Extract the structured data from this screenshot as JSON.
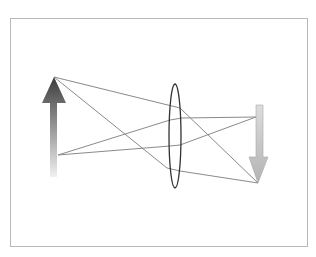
{
  "diagram": {
    "frame": {
      "x": 10,
      "y": 18,
      "width": 297,
      "height": 228,
      "stroke": "#b8b8b8"
    },
    "colors": {
      "ray": "#8a8a8a",
      "lens": "#333333",
      "object_dark": "#3c3c3c",
      "object_light": "#f0f0f0",
      "image_dark": "#b4b4b4",
      "image_light": "#dcdcdc"
    },
    "object_arrow": {
      "label": "object",
      "direction": "up",
      "shaft": {
        "x": 50,
        "y_top": 102,
        "y_bottom": 177,
        "width": 7
      },
      "head": {
        "tip": [
          54,
          77
        ],
        "base_y": 103,
        "base_left": 42,
        "base_right": 66
      }
    },
    "image_arrow": {
      "label": "image",
      "direction": "down",
      "shaft": {
        "x": 256,
        "y_top": 105,
        "y_bottom": 158,
        "width": 7
      },
      "head": {
        "tip": [
          258,
          183
        ],
        "base_y": 157,
        "base_left": 249,
        "base_right": 268
      }
    },
    "lens": {
      "label": "convex lens",
      "cx": 175,
      "cy": 136,
      "rx": 6,
      "ry": 52
    },
    "rays": [
      {
        "name": "top-ray-upper",
        "points": [
          [
            54,
            77
          ],
          [
            180,
            108
          ],
          [
            258,
            183
          ]
        ]
      },
      {
        "name": "top-ray-lower",
        "points": [
          [
            54,
            77
          ],
          [
            167,
            168
          ],
          [
            180,
            171
          ],
          [
            258,
            183
          ]
        ]
      },
      {
        "name": "bottom-ray-upper",
        "points": [
          [
            58,
            155
          ],
          [
            170,
            120
          ],
          [
            182,
            118
          ],
          [
            256,
            117
          ]
        ]
      },
      {
        "name": "bottom-ray-lower",
        "points": [
          [
            58,
            155
          ],
          [
            170,
            146
          ],
          [
            180,
            145
          ],
          [
            256,
            117
          ]
        ]
      }
    ]
  }
}
